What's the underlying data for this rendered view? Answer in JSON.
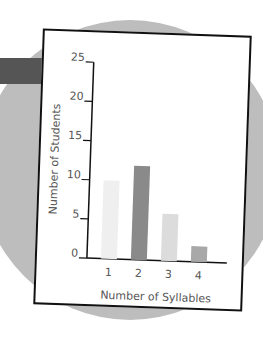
{
  "chart_data": {
    "type": "bar",
    "title": "",
    "xlabel": "Number of Syllables",
    "ylabel": "Number of Students",
    "categories": [
      "1",
      "2",
      "3",
      "4"
    ],
    "values": [
      10,
      12,
      6,
      2
    ],
    "ylim": [
      0,
      25
    ],
    "yticks": [
      0,
      5,
      10,
      15,
      20,
      25
    ],
    "bar_colors": [
      "#efefef",
      "#8a8a8a",
      "#dcdcdc",
      "#a8a8a8"
    ],
    "grid": false
  }
}
